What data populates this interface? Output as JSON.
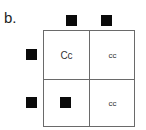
{
  "figure": {
    "label": "b."
  },
  "punnett_square": {
    "top_alleles": [
      "filled-square",
      "filled-square"
    ],
    "left_alleles": [
      "filled-square",
      "filled-square"
    ],
    "cells": [
      {
        "row": 0,
        "col": 0,
        "text": "Cc"
      },
      {
        "row": 0,
        "col": 1,
        "text": "cc"
      },
      {
        "row": 1,
        "col": 0,
        "text": "",
        "icon": "filled-square"
      },
      {
        "row": 1,
        "col": 1,
        "text": "cc"
      }
    ],
    "colors": {
      "square_fill": "#0a0a0a",
      "grid_line": "#6a6a6a",
      "text": "#333333"
    }
  }
}
